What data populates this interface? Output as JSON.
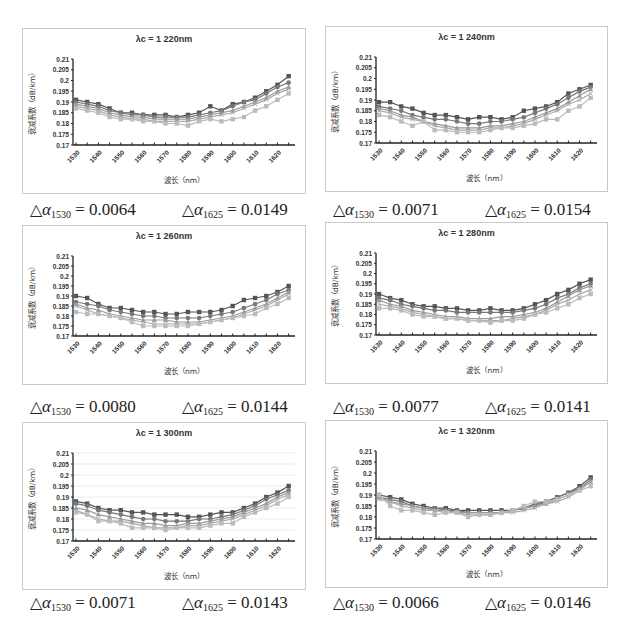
{
  "figure": {
    "x_ticks": [
      "1530",
      "1540",
      "1550",
      "1560",
      "1570",
      "1580",
      "1590",
      "1600",
      "1610",
      "1620"
    ],
    "y_ticks": [
      "0.21",
      "0.205",
      "0.2",
      "0.195",
      "0.19",
      "0.185",
      "0.18",
      "0.175",
      "0.17"
    ],
    "xlabel": "波长（nm）",
    "ylabel": "衰减系数（dB/km）",
    "delta_symbol": "△",
    "alpha_symbol": "α",
    "delta_1530_sub": "1530",
    "delta_1625_sub": "1625"
  },
  "panels": [
    {
      "title": "λc = 1 220nm",
      "delta_1530": "= 0.0064",
      "delta_1625": "= 0.0149"
    },
    {
      "title": "λc = 1 240nm",
      "delta_1530": "= 0.0071",
      "delta_1625": "= 0.0154"
    },
    {
      "title": "λc = 1 260nm",
      "delta_1530": "= 0.0080",
      "delta_1625": "= 0.0144"
    },
    {
      "title": "λc = 1 280nm",
      "delta_1530": "= 0.0077",
      "delta_1625": "= 0.0141"
    },
    {
      "title": "λc = 1 300nm",
      "delta_1530": "= 0.0071",
      "delta_1625": "= 0.0143"
    },
    {
      "title": "λc = 1 320nm",
      "delta_1530": "= 0.0066",
      "delta_1625": "= 0.0146"
    }
  ],
  "chart_data": [
    {
      "type": "line",
      "title": "λc = 1 220nm",
      "xlabel": "波长（nm）",
      "ylabel": "衰减系数（dB/km）",
      "ylim": [
        0.17,
        0.21
      ],
      "x": [
        1530,
        1535,
        1540,
        1545,
        1550,
        1555,
        1560,
        1565,
        1570,
        1575,
        1580,
        1585,
        1590,
        1595,
        1600,
        1605,
        1610,
        1615,
        1620,
        1625
      ],
      "series": [
        {
          "name": "s1",
          "values": [
            0.191,
            0.19,
            0.189,
            0.187,
            0.185,
            0.185,
            0.184,
            0.184,
            0.184,
            0.183,
            0.184,
            0.185,
            0.188,
            0.186,
            0.189,
            0.19,
            0.192,
            0.195,
            0.198,
            0.202
          ]
        },
        {
          "name": "s2",
          "values": [
            0.19,
            0.189,
            0.188,
            0.186,
            0.185,
            0.184,
            0.184,
            0.183,
            0.183,
            0.183,
            0.183,
            0.184,
            0.185,
            0.186,
            0.188,
            0.19,
            0.191,
            0.194,
            0.197,
            0.199
          ]
        },
        {
          "name": "s3",
          "values": [
            0.189,
            0.188,
            0.187,
            0.185,
            0.184,
            0.183,
            0.183,
            0.182,
            0.182,
            0.182,
            0.182,
            0.183,
            0.184,
            0.185,
            0.186,
            0.188,
            0.19,
            0.192,
            0.195,
            0.197
          ]
        },
        {
          "name": "s4",
          "values": [
            0.188,
            0.187,
            0.186,
            0.184,
            0.183,
            0.182,
            0.182,
            0.181,
            0.181,
            0.181,
            0.181,
            0.182,
            0.183,
            0.184,
            0.185,
            0.187,
            0.189,
            0.191,
            0.194,
            0.196
          ]
        },
        {
          "name": "s5",
          "values": [
            0.187,
            0.186,
            0.185,
            0.183,
            0.182,
            0.182,
            0.181,
            0.181,
            0.18,
            0.18,
            0.179,
            0.181,
            0.182,
            0.181,
            0.182,
            0.183,
            0.186,
            0.188,
            0.191,
            0.194
          ]
        }
      ]
    },
    {
      "type": "line",
      "title": "λc = 1 240nm",
      "xlabel": "波长（nm）",
      "ylabel": "衰减系数（dB/km）",
      "ylim": [
        0.17,
        0.21
      ],
      "x": [
        1530,
        1535,
        1540,
        1545,
        1550,
        1555,
        1560,
        1565,
        1570,
        1575,
        1580,
        1585,
        1590,
        1595,
        1600,
        1605,
        1610,
        1615,
        1620,
        1625
      ],
      "series": [
        {
          "name": "s1",
          "values": [
            0.189,
            0.189,
            0.187,
            0.186,
            0.184,
            0.183,
            0.183,
            0.182,
            0.181,
            0.182,
            0.182,
            0.181,
            0.182,
            0.185,
            0.186,
            0.187,
            0.189,
            0.193,
            0.195,
            0.197
          ]
        },
        {
          "name": "s2",
          "values": [
            0.187,
            0.186,
            0.185,
            0.183,
            0.182,
            0.181,
            0.181,
            0.18,
            0.179,
            0.179,
            0.18,
            0.18,
            0.181,
            0.182,
            0.184,
            0.186,
            0.188,
            0.191,
            0.194,
            0.196
          ]
        },
        {
          "name": "s3",
          "values": [
            0.186,
            0.185,
            0.183,
            0.182,
            0.18,
            0.179,
            0.178,
            0.177,
            0.177,
            0.177,
            0.178,
            0.178,
            0.179,
            0.18,
            0.182,
            0.184,
            0.186,
            0.189,
            0.192,
            0.195
          ]
        },
        {
          "name": "s4",
          "values": [
            0.185,
            0.184,
            0.182,
            0.181,
            0.18,
            0.178,
            0.177,
            0.176,
            0.176,
            0.176,
            0.177,
            0.177,
            0.178,
            0.179,
            0.181,
            0.183,
            0.185,
            0.188,
            0.19,
            0.193
          ]
        },
        {
          "name": "s5",
          "values": [
            0.183,
            0.182,
            0.18,
            0.178,
            0.18,
            0.176,
            0.176,
            0.175,
            0.175,
            0.175,
            0.176,
            0.177,
            0.177,
            0.178,
            0.179,
            0.181,
            0.181,
            0.185,
            0.187,
            0.191
          ]
        }
      ]
    },
    {
      "type": "line",
      "title": "λc = 1 260nm",
      "xlabel": "波长（nm）",
      "ylabel": "衰减系数（dB/km）",
      "ylim": [
        0.17,
        0.21
      ],
      "x": [
        1530,
        1535,
        1540,
        1545,
        1550,
        1555,
        1560,
        1565,
        1570,
        1575,
        1580,
        1585,
        1590,
        1595,
        1600,
        1605,
        1610,
        1615,
        1620,
        1625
      ],
      "series": [
        {
          "name": "s1",
          "values": [
            0.19,
            0.189,
            0.186,
            0.184,
            0.184,
            0.183,
            0.182,
            0.182,
            0.181,
            0.181,
            0.182,
            0.182,
            0.182,
            0.183,
            0.185,
            0.188,
            0.189,
            0.19,
            0.192,
            0.195
          ]
        },
        {
          "name": "s2",
          "values": [
            0.187,
            0.186,
            0.185,
            0.183,
            0.182,
            0.181,
            0.18,
            0.18,
            0.179,
            0.179,
            0.179,
            0.179,
            0.18,
            0.181,
            0.182,
            0.184,
            0.186,
            0.188,
            0.191,
            0.193
          ]
        },
        {
          "name": "s3",
          "values": [
            0.186,
            0.184,
            0.183,
            0.181,
            0.18,
            0.179,
            0.178,
            0.178,
            0.178,
            0.177,
            0.177,
            0.177,
            0.178,
            0.179,
            0.18,
            0.182,
            0.184,
            0.186,
            0.189,
            0.192
          ]
        },
        {
          "name": "s4",
          "values": [
            0.185,
            0.183,
            0.181,
            0.18,
            0.179,
            0.178,
            0.177,
            0.176,
            0.176,
            0.176,
            0.176,
            0.176,
            0.177,
            0.178,
            0.179,
            0.181,
            0.183,
            0.185,
            0.188,
            0.191
          ]
        },
        {
          "name": "s5",
          "values": [
            0.182,
            0.181,
            0.181,
            0.18,
            0.179,
            0.177,
            0.175,
            0.175,
            0.175,
            0.175,
            0.175,
            0.176,
            0.177,
            0.178,
            0.179,
            0.18,
            0.181,
            0.184,
            0.186,
            0.189
          ]
        }
      ]
    },
    {
      "type": "line",
      "title": "λc = 1 280nm",
      "xlabel": "波长（nm）",
      "ylabel": "衰减系数（dB/km）",
      "ylim": [
        0.17,
        0.21
      ],
      "x": [
        1530,
        1535,
        1540,
        1545,
        1550,
        1555,
        1560,
        1565,
        1570,
        1575,
        1580,
        1585,
        1590,
        1595,
        1600,
        1605,
        1610,
        1615,
        1620,
        1625
      ],
      "series": [
        {
          "name": "s1",
          "values": [
            0.19,
            0.188,
            0.187,
            0.185,
            0.184,
            0.184,
            0.183,
            0.183,
            0.182,
            0.182,
            0.183,
            0.182,
            0.182,
            0.183,
            0.185,
            0.187,
            0.19,
            0.192,
            0.195,
            0.197
          ]
        },
        {
          "name": "s2",
          "values": [
            0.188,
            0.187,
            0.185,
            0.184,
            0.183,
            0.182,
            0.182,
            0.181,
            0.181,
            0.181,
            0.181,
            0.181,
            0.181,
            0.182,
            0.183,
            0.185,
            0.188,
            0.19,
            0.193,
            0.195
          ]
        },
        {
          "name": "s3",
          "values": [
            0.187,
            0.185,
            0.184,
            0.182,
            0.181,
            0.18,
            0.179,
            0.179,
            0.178,
            0.178,
            0.178,
            0.179,
            0.179,
            0.18,
            0.181,
            0.183,
            0.186,
            0.189,
            0.192,
            0.194
          ]
        },
        {
          "name": "s4",
          "values": [
            0.185,
            0.184,
            0.183,
            0.181,
            0.18,
            0.179,
            0.178,
            0.178,
            0.177,
            0.177,
            0.177,
            0.177,
            0.178,
            0.179,
            0.18,
            0.182,
            0.185,
            0.187,
            0.19,
            0.192
          ]
        },
        {
          "name": "s5",
          "values": [
            0.183,
            0.183,
            0.182,
            0.18,
            0.179,
            0.179,
            0.178,
            0.178,
            0.177,
            0.177,
            0.176,
            0.177,
            0.177,
            0.178,
            0.18,
            0.181,
            0.183,
            0.185,
            0.188,
            0.19
          ]
        }
      ]
    },
    {
      "type": "line",
      "title": "λc = 1 300nm",
      "xlabel": "波长（nm）",
      "ylabel": "衰减系数（dB/km）",
      "ylim": [
        0.17,
        0.21
      ],
      "grid": true,
      "x": [
        1530,
        1535,
        1540,
        1545,
        1550,
        1555,
        1560,
        1565,
        1570,
        1575,
        1580,
        1585,
        1590,
        1595,
        1600,
        1605,
        1610,
        1615,
        1620,
        1625
      ],
      "series": [
        {
          "name": "s1",
          "values": [
            0.188,
            0.187,
            0.185,
            0.184,
            0.184,
            0.183,
            0.183,
            0.182,
            0.182,
            0.182,
            0.181,
            0.181,
            0.182,
            0.183,
            0.183,
            0.185,
            0.187,
            0.19,
            0.192,
            0.195
          ]
        },
        {
          "name": "s2",
          "values": [
            0.187,
            0.186,
            0.184,
            0.183,
            0.182,
            0.181,
            0.18,
            0.18,
            0.179,
            0.179,
            0.179,
            0.18,
            0.18,
            0.181,
            0.182,
            0.184,
            0.186,
            0.189,
            0.191,
            0.193
          ]
        },
        {
          "name": "s3",
          "values": [
            0.185,
            0.184,
            0.182,
            0.181,
            0.18,
            0.179,
            0.178,
            0.178,
            0.177,
            0.177,
            0.178,
            0.178,
            0.179,
            0.18,
            0.181,
            0.183,
            0.185,
            0.187,
            0.19,
            0.192
          ]
        },
        {
          "name": "s4",
          "values": [
            0.184,
            0.182,
            0.18,
            0.179,
            0.179,
            0.178,
            0.177,
            0.176,
            0.176,
            0.176,
            0.177,
            0.177,
            0.178,
            0.179,
            0.18,
            0.182,
            0.184,
            0.186,
            0.189,
            0.191
          ]
        },
        {
          "name": "s5",
          "values": [
            0.183,
            0.182,
            0.179,
            0.179,
            0.178,
            0.176,
            0.176,
            0.176,
            0.175,
            0.176,
            0.176,
            0.176,
            0.177,
            0.178,
            0.178,
            0.181,
            0.183,
            0.185,
            0.187,
            0.19
          ]
        }
      ]
    },
    {
      "type": "line",
      "title": "λc = 1 320nm",
      "xlabel": "波长（nm）",
      "ylabel": "衰减系数（dB/km）",
      "ylim": [
        0.17,
        0.21
      ],
      "x": [
        1530,
        1535,
        1540,
        1545,
        1550,
        1555,
        1560,
        1565,
        1570,
        1575,
        1580,
        1585,
        1590,
        1595,
        1600,
        1605,
        1610,
        1615,
        1620,
        1625
      ],
      "series": [
        {
          "name": "s1",
          "values": [
            0.19,
            0.189,
            0.188,
            0.186,
            0.185,
            0.184,
            0.184,
            0.183,
            0.183,
            0.183,
            0.183,
            0.183,
            0.183,
            0.184,
            0.186,
            0.187,
            0.189,
            0.191,
            0.194,
            0.198
          ]
        },
        {
          "name": "s2",
          "values": [
            0.189,
            0.188,
            0.187,
            0.185,
            0.184,
            0.184,
            0.183,
            0.183,
            0.182,
            0.182,
            0.182,
            0.182,
            0.183,
            0.184,
            0.185,
            0.187,
            0.189,
            0.191,
            0.193,
            0.197
          ]
        },
        {
          "name": "s3",
          "values": [
            0.189,
            0.187,
            0.186,
            0.185,
            0.184,
            0.183,
            0.183,
            0.182,
            0.182,
            0.182,
            0.182,
            0.182,
            0.183,
            0.184,
            0.185,
            0.186,
            0.188,
            0.19,
            0.193,
            0.196
          ]
        },
        {
          "name": "s4",
          "values": [
            0.188,
            0.187,
            0.185,
            0.184,
            0.183,
            0.183,
            0.182,
            0.182,
            0.181,
            0.181,
            0.181,
            0.182,
            0.182,
            0.183,
            0.184,
            0.186,
            0.187,
            0.189,
            0.192,
            0.196
          ]
        },
        {
          "name": "s5",
          "values": [
            0.19,
            0.185,
            0.183,
            0.183,
            0.182,
            0.181,
            0.182,
            0.182,
            0.18,
            0.181,
            0.181,
            0.182,
            0.183,
            0.185,
            0.187,
            0.187,
            0.188,
            0.19,
            0.192,
            0.194
          ]
        }
      ]
    }
  ]
}
